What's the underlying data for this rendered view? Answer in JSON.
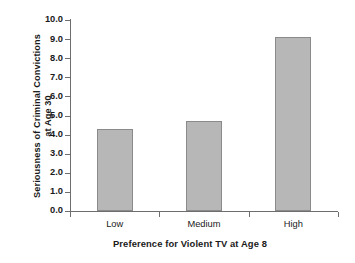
{
  "chart_data": {
    "type": "bar",
    "title": "",
    "categories": [
      "Low",
      "Medium",
      "High"
    ],
    "values": [
      4.3,
      4.7,
      9.1
    ],
    "series": [
      {
        "name": "Seriousness of Criminal Convictions at Age 30",
        "values": [
          4.3,
          4.7,
          9.1
        ]
      }
    ],
    "xlabel": "Preference for Violent TV at Age 8",
    "ylabel": "Seriousness of Criminal Convictions at Age 30",
    "ylabel_lines": [
      "Seriousness of Criminal Convictions",
      "at Age 30"
    ],
    "ylim": [
      0.0,
      10.0
    ],
    "ytick_labels": [
      "10.0",
      "9.0",
      "8.0",
      "7.0",
      "6.0",
      "5.0",
      "4.0",
      "3.0",
      "2.0",
      "1.0",
      "0.0"
    ],
    "ytick_values": [
      10.0,
      9.0,
      8.0,
      7.0,
      6.0,
      5.0,
      4.0,
      3.0,
      2.0,
      1.0,
      0.0
    ],
    "grid": false,
    "legend": "none",
    "bar_fill_color": "#b7b7b7",
    "bar_border_color": "#8a8a8a",
    "axis_color": "#6e6e6e",
    "background_color": "#ffffff"
  }
}
